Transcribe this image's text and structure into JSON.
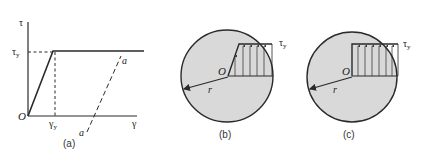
{
  "figure": {
    "panels": [
      {
        "id": "a",
        "caption": "(a)",
        "type": "stress-strain-curve",
        "axis_y_label": "τ",
        "axis_x_label": "γ",
        "origin_label": "O",
        "yield_stress_label": "τ",
        "yield_stress_sub": "y",
        "yield_strain_label": "γ",
        "yield_strain_sub": "y",
        "unload_line_top_label": "a",
        "unload_line_bottom_label": "a"
      },
      {
        "id": "b",
        "caption": "(b)",
        "type": "cross-section-partially-plastic",
        "origin_label": "O",
        "radius_label": "r",
        "stress_label": "τ",
        "stress_sub": "y"
      },
      {
        "id": "c",
        "caption": "(c)",
        "type": "cross-section-fully-plastic",
        "origin_label": "O",
        "radius_label": "r",
        "stress_label": "τ",
        "stress_sub": "y"
      }
    ],
    "colors": {
      "line": "#2a2a2a",
      "section_fill": "#d9d9d9",
      "background": "#ffffff"
    }
  }
}
